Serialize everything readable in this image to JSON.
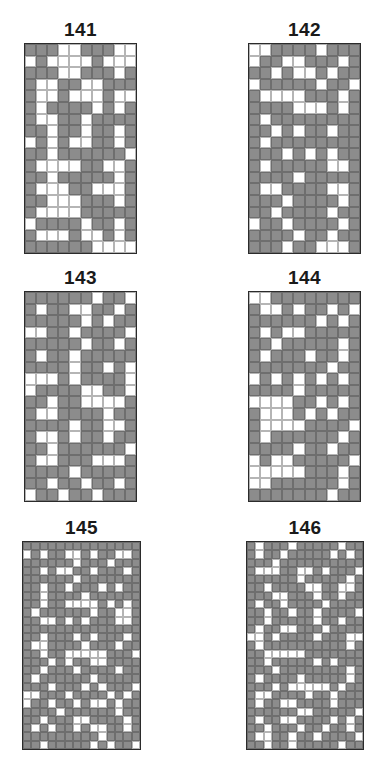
{
  "colors": {
    "filled": "#8c8c8c",
    "empty": "#ffffff",
    "border": "#2b2b2b"
  },
  "panels": [
    {
      "label": "141",
      "cols": 10,
      "rows": 18,
      "pos": {
        "left": 24,
        "top": 43,
        "width": 113,
        "height": 211,
        "titleTop": 20
      },
      "cells": [
        "1110011100",
        "0100001000",
        "1110011101",
        "1001100111",
        "1001000100",
        "1011110101",
        "1001101111",
        "1101101101",
        "0101001101",
        "1101111110",
        "1000011001",
        "1101111101",
        "1000110001",
        "1100011101",
        "1000011111",
        "0111101101",
        "1000100101",
        "1111110000"
      ]
    },
    {
      "label": "142",
      "cols": 10,
      "rows": 18,
      "pos": {
        "left": 248,
        "top": 43,
        "width": 113,
        "height": 211,
        "titleTop": 20
      },
      "cells": [
        "0011110111",
        "0110011101",
        "1101001011",
        "0111110110",
        "1000011101",
        "1111000101",
        "1011111111",
        "1101011011",
        "1011111111",
        "1110101011",
        "1011111001",
        "1111011111",
        "1001111001",
        "1110111101",
        "1101111011",
        "0110111101",
        "1111011011",
        "1110110001"
      ]
    },
    {
      "label": "143",
      "cols": 10,
      "rows": 18,
      "pos": {
        "left": 24,
        "top": 291,
        "width": 113,
        "height": 211,
        "titleTop": 268
      },
      "cells": [
        "1111110110",
        "1011001101",
        "1111101011",
        "0011011110",
        "1111101101",
        "1011011111",
        "1111011010",
        "0001011110",
        "0111100110",
        "1101100001",
        "1001111011",
        "1111011001",
        "1001011011",
        "1101111110",
        "1001110001",
        "1111011111",
        "1101101101",
        "0110110111"
      ]
    },
    {
      "label": "144",
      "cols": 10,
      "rows": 18,
      "pos": {
        "left": 248,
        "top": 291,
        "width": 113,
        "height": 211,
        "titleTop": 268
      },
      "cells": [
        "0011111111",
        "1001011010",
        "1111110101",
        "1010011111",
        "1101111101",
        "1011101101",
        "1111111011",
        "0101010101",
        "1111011111",
        "0000110101",
        "1000101011",
        "1000011110",
        "1011111101",
        "1111011011",
        "0100111110",
        "0000011101",
        "0011111101",
        "1111111011"
      ]
    },
    {
      "label": "145",
      "cols": 14,
      "rows": 25,
      "pos": {
        "left": 22,
        "top": 541,
        "width": 119,
        "height": 209,
        "titleTop": 518
      },
      "cells": [
        "11111111111111",
        "01011001011001",
        "11111101110111",
        "11010011011101",
        "11111101111111",
        "11011011101011",
        "11011110111111",
        "11011000010101",
        "10111111011001",
        "11001010111001",
        "11111111111111",
        "11011101011101",
        "10011110111011",
        "11011000001110",
        "11101011001111",
        "11011101111011",
        "10111111011111",
        "11101110101110",
        "00111011110101",
        "01101101001011",
        "11110111111011",
        "11011100111101",
        "10101101001101",
        "11111111101111",
        "11011111010110"
      ]
    },
    {
      "label": "146",
      "cols": 14,
      "rows": 25,
      "pos": {
        "left": 246,
        "top": 541,
        "width": 118,
        "height": 209,
        "titleTop": 518
      },
      "cells": [
        "10111011111011",
        "10110111110101",
        "11101111111111",
        "10001100101110",
        "11111101111101",
        "11011110011001",
        "11100111011011",
        "10110111101111",
        "11011011011110",
        "11011111011011",
        "10110011101111",
        "00101111011100",
        "10111111111101",
        "11000001111111",
        "11011111010111",
        "11101111111101",
        "10111101111101",
        "11101000001011",
        "10011110110111",
        "10110011110111",
        "11111100111110",
        "10110011110101",
        "11011101101101",
        "10011011011110",
        "11011011111011"
      ]
    }
  ]
}
